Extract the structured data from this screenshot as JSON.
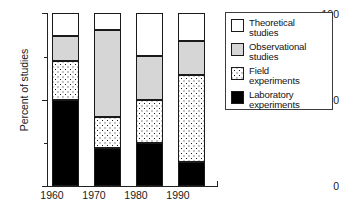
{
  "chart_data": {
    "type": "bar",
    "subtype": "stacked-bar",
    "title": "",
    "xlabel": "",
    "ylabel": "Percent of studies",
    "categories": [
      "1960",
      "1970",
      "1980",
      "1990"
    ],
    "ylim": [
      0,
      100
    ],
    "yticks": [
      0,
      50,
      100
    ],
    "ytick_labels": [
      "0",
      "50",
      "100"
    ],
    "yminor_ticks": [
      25,
      75
    ],
    "grid": false,
    "legend_position": "right",
    "stack_order_bottom_to_top": [
      "Laboratory experiments",
      "Field experiments",
      "Observational studies",
      "Theoretical studies"
    ],
    "series": [
      {
        "name": "Laboratory experiments",
        "legend_label_line1": "Laboratory",
        "legend_label_line2": "experiments",
        "fill": "solid-black",
        "color": "#000000",
        "values": [
          50,
          22,
          25,
          14
        ]
      },
      {
        "name": "Field experiments",
        "legend_label_line1": "Field",
        "legend_label_line2": "experiments",
        "fill": "dotted-pattern",
        "color": "#ffffff",
        "values": [
          22,
          18,
          25,
          50
        ]
      },
      {
        "name": "Observational studies",
        "legend_label_line1": "Observational",
        "legend_label_line2": "studies",
        "fill": "light-gray",
        "color": "#d6d6d6",
        "values": [
          15,
          50,
          25,
          20
        ]
      },
      {
        "name": "Theoretical studies",
        "legend_label_line1": "Theoretical",
        "legend_label_line2": "studies",
        "fill": "white",
        "color": "#ffffff",
        "values": [
          13,
          10,
          25,
          16
        ]
      }
    ]
  },
  "axis": {
    "ylabel": "Percent of studies",
    "ytick_100": "100",
    "ytick_50": "50",
    "ytick_0": "0",
    "xticks": [
      "1960",
      "1970",
      "1980",
      "1990"
    ]
  },
  "legend": {
    "items": [
      {
        "line1": "Theoretical",
        "line2": "studies",
        "swatch": "white-swatch"
      },
      {
        "line1": "Observational",
        "line2": "studies",
        "swatch": "gray-swatch"
      },
      {
        "line1": "Field",
        "line2": "experiments",
        "swatch": "dotted-swatch"
      },
      {
        "line1": "Laboratory",
        "line2": "experiments",
        "swatch": "black-swatch"
      }
    ]
  }
}
